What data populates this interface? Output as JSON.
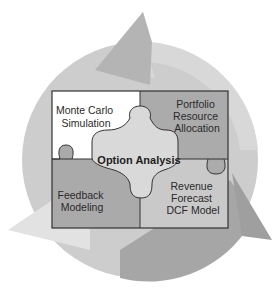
{
  "diagram": {
    "type": "cycle-puzzle",
    "center": {
      "label": "Option Analysis"
    },
    "pieces": [
      {
        "position": "top-left",
        "lines": [
          "Monte Carlo",
          "Simulation"
        ],
        "color": "#ffffff"
      },
      {
        "position": "top-right",
        "lines": [
          "Portfolio",
          "Resource",
          "Allocation"
        ],
        "color": "#a9a9a9"
      },
      {
        "position": "bottom-left",
        "lines": [
          "Feedback",
          "Modeling"
        ],
        "color": "#a9a9a9"
      },
      {
        "position": "bottom-right",
        "lines": [
          "Revenue",
          "Forecast",
          "DCF Model"
        ],
        "color": "#c8c8c8"
      }
    ],
    "colors": {
      "circle_light": "#cdcdcd",
      "arrow_dark": "#a8a8a8",
      "center_piece": "#d9d9d9",
      "outline": "#333333"
    }
  }
}
